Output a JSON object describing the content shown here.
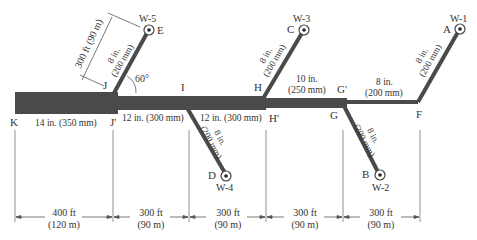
{
  "colors": {
    "pipe": "#4a4a4a",
    "line": "#555555",
    "background": "#ffffff"
  },
  "nodes": {
    "K": "K",
    "J": "J",
    "J_prime": "J'",
    "I": "I",
    "H": "H",
    "H_prime": "H'",
    "G": "G",
    "G_prime": "G'",
    "F": "F",
    "A": "A",
    "B": "B",
    "C": "C",
    "D": "D",
    "E": "E"
  },
  "wells": {
    "w1": "W-1",
    "w2": "W-2",
    "w3": "W-3",
    "w4": "W-4",
    "w5": "W-5"
  },
  "pipes": {
    "KJ": "14 in. (350 mm)",
    "JI": "12 in. (300 mm)",
    "IH": "12 in. (300 mm)",
    "HG_line1": "10 in.",
    "HG_line2": "(250 mm)",
    "GF_line1": "8 in.",
    "GF_line2": "(200 mm)",
    "FA_line1": "8 in.",
    "FA_line2": "(200 mm)",
    "GB_line1": "8 in.",
    "GB_line2": "(200 mm)",
    "HC_line1": "8 in.",
    "HC_line2": "(200 mm)",
    "ID_line1": "8 in.",
    "ID_line2": "(200 mm)",
    "JE_line1": "8 in.",
    "JE_line2": "(200 mm)"
  },
  "angle_label": "60°",
  "je_length": "300 ft (90 m)",
  "dimensions": [
    {
      "ft": "400 ft",
      "m": "(120 m)"
    },
    {
      "ft": "300 ft",
      "m": "(90 m)"
    },
    {
      "ft": "300 ft",
      "m": "(90 m)"
    },
    {
      "ft": "300 ft",
      "m": "(90 m)"
    },
    {
      "ft": "300 ft",
      "m": "(90 m)"
    }
  ]
}
